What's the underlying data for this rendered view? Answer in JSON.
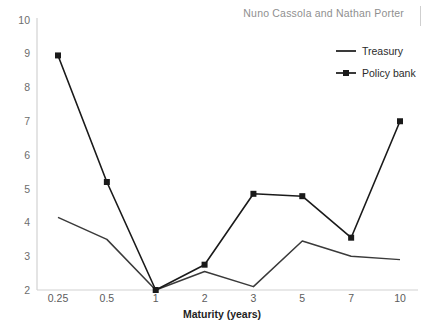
{
  "header": {
    "byline": "Nuno Cassola and Nathan Porter",
    "divider": "vertical-rule"
  },
  "legend": {
    "position": "top-right",
    "items": [
      {
        "label": "Treasury",
        "color": "#3a3a3a",
        "marker": "none"
      },
      {
        "label": "Policy bank",
        "color": "#1a1a1a",
        "marker": "square"
      }
    ]
  },
  "axes": {
    "x_title": "Maturity (years)",
    "y_title": "",
    "y_ticks": [
      "10",
      "9",
      "8",
      "7",
      "6",
      "5",
      "4",
      "3",
      "2"
    ],
    "x_ticks": [
      "0.25",
      "0.5",
      "1",
      "2",
      "3",
      "5",
      "7",
      "10"
    ]
  },
  "chart_data": {
    "type": "line",
    "title": "",
    "subtitle": "",
    "xlabel": "Maturity (years)",
    "ylabel": "",
    "categories": [
      "0.25",
      "0.5",
      "1",
      "2",
      "3",
      "5",
      "7",
      "10"
    ],
    "series": [
      {
        "name": "Treasury",
        "color": "#3a3a3a",
        "marker": "none",
        "values": [
          4.15,
          3.5,
          2.0,
          2.55,
          2.1,
          3.45,
          3.0,
          2.9
        ]
      },
      {
        "name": "Policy bank",
        "color": "#1a1a1a",
        "marker": "square",
        "values": [
          8.95,
          5.2,
          2.0,
          2.75,
          4.85,
          4.78,
          3.55,
          7.0
        ]
      }
    ],
    "ylim": [
      2,
      10
    ],
    "ytick_values": [
      2,
      3,
      4,
      5,
      6,
      7,
      8,
      9,
      10
    ],
    "grid": false,
    "legend_position": "top-right"
  }
}
